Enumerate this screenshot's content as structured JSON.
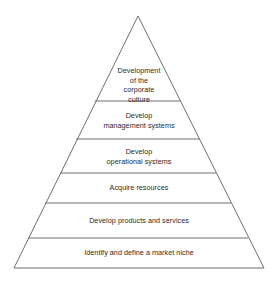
{
  "diagram": {
    "type": "pyramid",
    "line_color": "#6e6e6e",
    "background": "#ffffff",
    "levels": [
      {
        "label_lines": [
          "Development",
          "of the",
          "corporate",
          "culture"
        ]
      },
      {
        "label_lines": [
          "Develop",
          "management systems"
        ]
      },
      {
        "label_lines": [
          "Develop",
          "operational systems"
        ]
      },
      {
        "label_lines": [
          "Acquire resources"
        ]
      },
      {
        "label_lines": [
          "Develop products and services"
        ]
      },
      {
        "label_lines": [
          "Identify and define a market niche"
        ]
      }
    ]
  }
}
